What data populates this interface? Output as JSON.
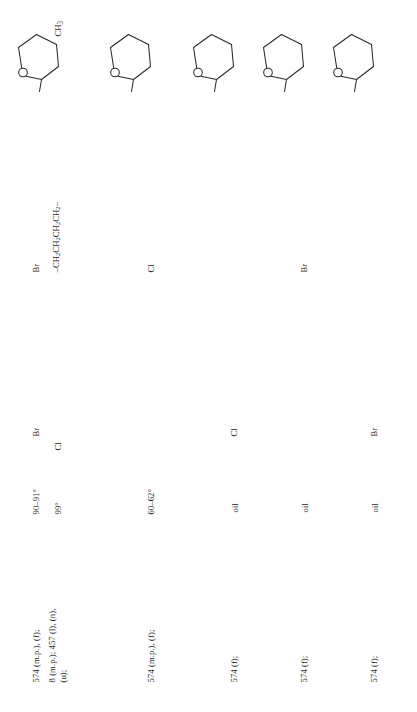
{
  "page": {
    "kind": "scanned-table-page",
    "orientation": "rotated-90-ccw",
    "background_color": "#ffffff",
    "ink_color": "#1d1d1d"
  },
  "table": {
    "rows": [
      {
        "id": "row-1",
        "structure": {
          "name": "tetrahydropyran-ring",
          "oxygen_label": "O",
          "methyl_label": "CH3"
        },
        "substituent": "Br",
        "halogen": "Br",
        "melting_point": "90–91°",
        "references": "574 (m.p.), (f);"
      },
      {
        "id": "row-2",
        "structure": null,
        "substituent": "–CH2CH2CH2CH2–",
        "halogen": "Cl",
        "melting_point": "99°",
        "references": "8 (m.p.); 457 (l), (n), (u);"
      },
      {
        "id": "row-3",
        "structure": {
          "name": "tetrahydropyran-ring",
          "oxygen_label": "O",
          "methyl_label": null
        },
        "substituent": "Cl",
        "halogen": null,
        "melting_point": "60–62°",
        "references": "574 (m.p.), (f);"
      },
      {
        "id": "row-4",
        "structure": {
          "name": "tetrahydropyran-ring",
          "oxygen_label": "O",
          "methyl_label": null
        },
        "substituent": null,
        "halogen": "Cl",
        "melting_point": "oil",
        "references": "574 (f);"
      },
      {
        "id": "row-5",
        "structure": {
          "name": "tetrahydropyran-ring",
          "oxygen_label": "O",
          "methyl_label": null
        },
        "substituent": "Br",
        "halogen": null,
        "melting_point": "oil",
        "references": "574 (f);"
      },
      {
        "id": "row-6",
        "structure": {
          "name": "tetrahydropyran-ring",
          "oxygen_label": "O",
          "methyl_label": null
        },
        "substituent": null,
        "halogen": "Br",
        "melting_point": "oil",
        "references": "574 (f);"
      }
    ]
  },
  "text": {
    "ref_r1": "574 (m.p.), (f);",
    "ref_r2_line1": "8 (m.p.); 457 (l), (n),",
    "ref_r2_line2": "(u);",
    "ref_r3": "574 (m.p.), (f);",
    "ref_r4": "574 (f);",
    "ref_r5": "574 (f);",
    "ref_r6": "574 (f);",
    "mp_r1": "90–91°",
    "mp_r2": "99°",
    "mp_r3": "60–62°",
    "mp_r4": "oil",
    "mp_r5": "oil",
    "mp_r6": "oil",
    "hal_r1": "Br",
    "hal_r2": "Cl",
    "hal_r4": "Cl",
    "hal_r6": "Br",
    "sub_r1": "Br",
    "sub_r3": "Cl",
    "sub_r5": "Br",
    "chain_r2_pre": "–CH",
    "chain_r2_sub": "2",
    "chain_r2_full": "–CH2CH2CH2CH2–",
    "o_label": "O",
    "ch3_label_pre": "CH",
    "ch3_label_sub": "3"
  }
}
